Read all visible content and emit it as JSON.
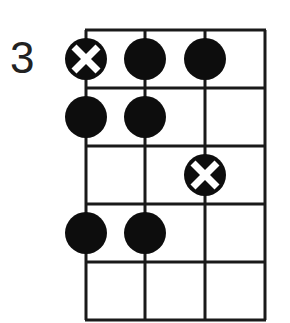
{
  "diagram": {
    "type": "fretboard-scale-pattern",
    "start_fret_label": "3",
    "strings": 4,
    "frets": 5,
    "colors": {
      "line": "#1a1a1a",
      "dot": "#0d0d0d",
      "root_mark": "#ffffff"
    },
    "notes": [
      {
        "string": 1,
        "fret": 1,
        "root": true
      },
      {
        "string": 2,
        "fret": 1,
        "root": false
      },
      {
        "string": 3,
        "fret": 1,
        "root": false
      },
      {
        "string": 1,
        "fret": 2,
        "root": false
      },
      {
        "string": 2,
        "fret": 2,
        "root": false
      },
      {
        "string": 3,
        "fret": 3,
        "root": true
      },
      {
        "string": 1,
        "fret": 4,
        "root": false
      },
      {
        "string": 2,
        "fret": 4,
        "root": false
      }
    ]
  }
}
